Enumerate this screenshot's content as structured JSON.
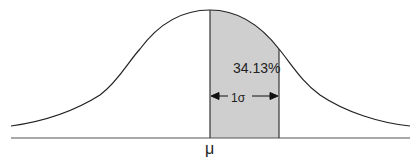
{
  "diagram": {
    "type": "normal-distribution",
    "shaded_region_label": "34.13%",
    "interval_label": "1σ",
    "mean_label": "μ",
    "colors": {
      "curve": "#222222",
      "shade": "#cfcfcf",
      "baseline": "#555555"
    }
  }
}
